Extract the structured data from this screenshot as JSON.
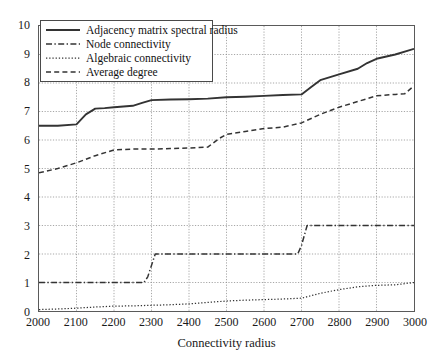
{
  "chart_data": {
    "type": "line",
    "title": "",
    "xlabel": "Connectivity radius",
    "ylabel": "",
    "xlim": [
      2000,
      3000
    ],
    "ylim": [
      0,
      10
    ],
    "xticks": [
      2000,
      2100,
      2200,
      2300,
      2400,
      2500,
      2600,
      2700,
      2800,
      2900,
      3000
    ],
    "yticks": [
      0,
      1,
      2,
      3,
      4,
      5,
      6,
      7,
      8,
      9,
      10
    ],
    "grid": true,
    "legend_position": "upper-left",
    "series": [
      {
        "name": "Adjacency matrix spectral radius",
        "style": "solid",
        "color": "#333333",
        "x": [
          2000,
          2050,
          2100,
          2125,
          2150,
          2175,
          2200,
          2250,
          2275,
          2300,
          2350,
          2400,
          2450,
          2500,
          2550,
          2600,
          2650,
          2700,
          2725,
          2750,
          2800,
          2850,
          2875,
          2900,
          2950,
          3000
        ],
        "y": [
          6.5,
          6.5,
          6.55,
          6.9,
          7.1,
          7.12,
          7.15,
          7.2,
          7.3,
          7.4,
          7.42,
          7.43,
          7.45,
          7.5,
          7.52,
          7.55,
          7.58,
          7.6,
          7.85,
          8.1,
          8.3,
          8.5,
          8.7,
          8.85,
          9.0,
          9.2
        ]
      },
      {
        "name": "Node connectivity",
        "style": "dashdot",
        "color": "#333333",
        "x": [
          2000,
          2280,
          2290,
          2310,
          2690,
          2700,
          2715,
          3000
        ],
        "y": [
          1,
          1,
          1.2,
          2,
          2,
          2.3,
          3,
          3
        ]
      },
      {
        "name": "Algebraic connectivity",
        "style": "dotted",
        "color": "#333333",
        "x": [
          2000,
          2050,
          2100,
          2150,
          2200,
          2250,
          2300,
          2350,
          2400,
          2450,
          2500,
          2550,
          2600,
          2650,
          2700,
          2750,
          2800,
          2850,
          2900,
          2950,
          3000
        ],
        "y": [
          0.05,
          0.07,
          0.1,
          0.14,
          0.17,
          0.18,
          0.2,
          0.22,
          0.25,
          0.3,
          0.35,
          0.38,
          0.4,
          0.42,
          0.45,
          0.62,
          0.75,
          0.85,
          0.9,
          0.92,
          1.0
        ]
      },
      {
        "name": "Average degree",
        "style": "dashed",
        "color": "#333333",
        "x": [
          2000,
          2050,
          2100,
          2150,
          2200,
          2250,
          2300,
          2350,
          2400,
          2450,
          2480,
          2500,
          2550,
          2600,
          2650,
          2700,
          2750,
          2800,
          2850,
          2900,
          2950,
          2975,
          3000
        ],
        "y": [
          4.85,
          5.0,
          5.2,
          5.45,
          5.65,
          5.68,
          5.68,
          5.7,
          5.72,
          5.75,
          6.05,
          6.2,
          6.3,
          6.4,
          6.45,
          6.6,
          6.9,
          7.15,
          7.35,
          7.55,
          7.6,
          7.62,
          7.9
        ]
      }
    ]
  },
  "axes": {
    "x_title": "Connectivity radius",
    "x_tick_labels": [
      "2000",
      "2100",
      "2200",
      "2300",
      "2400",
      "2500",
      "2600",
      "2700",
      "2800",
      "2900",
      "3000"
    ],
    "y_tick_labels": [
      "0",
      "1",
      "2",
      "3",
      "4",
      "5",
      "6",
      "7",
      "8",
      "9",
      "10"
    ]
  },
  "legend": {
    "items": [
      {
        "label": "Adjacency matrix spectral radius",
        "style": "solid"
      },
      {
        "label": "Node connectivity",
        "style": "dashdot"
      },
      {
        "label": "Algebraic connectivity",
        "style": "dotted"
      },
      {
        "label": "Average degree",
        "style": "dashed"
      }
    ]
  },
  "colors": {
    "line": "#333333",
    "grid": "#909090",
    "axis": "#5a5a5a",
    "background": "#ffffff"
  }
}
